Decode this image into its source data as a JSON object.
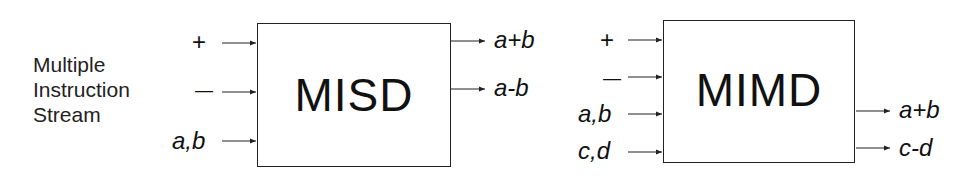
{
  "side_label": [
    "Multiple",
    "Instruction",
    "Stream"
  ],
  "misd": {
    "title": "MISD",
    "inputs": [
      "+",
      "—",
      "a,b"
    ],
    "outputs": [
      "a+b",
      "a-b"
    ]
  },
  "mimd": {
    "title": "MIMD",
    "inputs": [
      "+",
      "—",
      "a,b",
      "c,d"
    ],
    "outputs": [
      "a+b",
      "c-d"
    ]
  },
  "colors": {
    "line": "#222222",
    "text": "#111111",
    "background": "#ffffff"
  }
}
